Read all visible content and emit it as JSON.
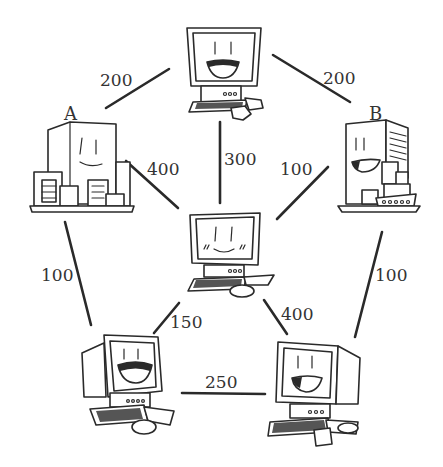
{
  "nodes": {
    "top": {
      "label": "",
      "type": "computer"
    },
    "a": {
      "label": "A",
      "type": "building"
    },
    "b": {
      "label": "B",
      "type": "building"
    },
    "center": {
      "label": "",
      "type": "computer"
    },
    "bottom_left": {
      "label": "",
      "type": "computer"
    },
    "bottom_right": {
      "label": "",
      "type": "computer"
    }
  },
  "edges": [
    {
      "from": "a",
      "to": "top",
      "weight": "200"
    },
    {
      "from": "top",
      "to": "b",
      "weight": "200"
    },
    {
      "from": "top",
      "to": "center",
      "weight": "300"
    },
    {
      "from": "a",
      "to": "center",
      "weight": "400"
    },
    {
      "from": "b",
      "to": "center",
      "weight": "100"
    },
    {
      "from": "a",
      "to": "bottom_left",
      "weight": "100"
    },
    {
      "from": "b",
      "to": "bottom_right",
      "weight": "100"
    },
    {
      "from": "center",
      "to": "bottom_left",
      "weight": "150"
    },
    {
      "from": "center",
      "to": "bottom_right",
      "weight": "400"
    },
    {
      "from": "bottom_left",
      "to": "bottom_right",
      "weight": "250"
    }
  ],
  "colors": {
    "ink": "#2a2a2a",
    "background": "#ffffff"
  }
}
